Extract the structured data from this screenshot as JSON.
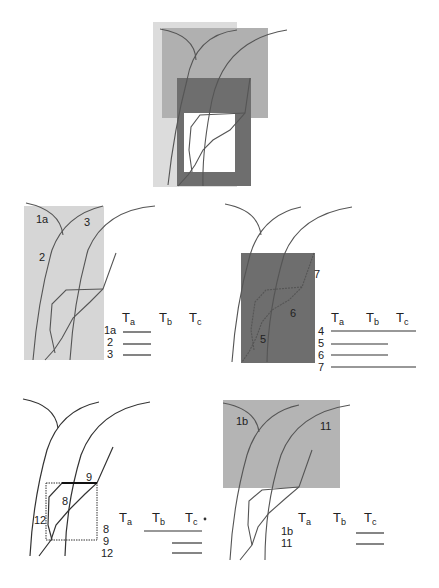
{
  "figure": {
    "colors": {
      "light_shade": "#cfcfcf",
      "mid_shade": "#a8a8a8",
      "dark_shade": "#6e6e6e",
      "line": "#333333",
      "background": "#ffffff"
    },
    "overview_panel": {
      "description": "Composite of all shaded regions"
    },
    "panels": [
      {
        "id": "panel-1",
        "region_labels": [
          "1a",
          "2",
          "3"
        ],
        "table": {
          "headers": [
            "T",
            "T",
            "T"
          ],
          "header_subscripts": [
            "a",
            "b",
            "c"
          ],
          "rows": [
            {
              "label": "1a",
              "spans": [
                "Ta"
              ]
            },
            {
              "label": "2",
              "spans": [
                "Ta"
              ]
            },
            {
              "label": "3",
              "spans": [
                "Ta"
              ]
            }
          ]
        }
      },
      {
        "id": "panel-2",
        "region_labels": [
          "7",
          "6",
          "5"
        ],
        "table": {
          "headers": [
            "T",
            "T",
            "T"
          ],
          "header_subscripts": [
            "a",
            "b",
            "c"
          ],
          "rows": [
            {
              "label": "4",
              "spans": [
                "Ta",
                "Tb",
                "Tc"
              ]
            },
            {
              "label": "5",
              "spans": [
                "Ta",
                "Tb"
              ]
            },
            {
              "label": "6",
              "spans": [
                "Ta",
                "Tb"
              ]
            },
            {
              "label": "7",
              "spans": [
                "Ta",
                "Tb",
                "Tc"
              ]
            }
          ]
        }
      },
      {
        "id": "panel-3",
        "region_labels": [
          "9",
          "8",
          "12"
        ],
        "table": {
          "headers": [
            "T",
            "T",
            "T"
          ],
          "header_subscripts": [
            "a",
            "b",
            "c"
          ],
          "rows": [
            {
              "label": "8",
              "spans": [
                "Tb",
                "Tc"
              ]
            },
            {
              "label": "9",
              "spans": [
                "Tc"
              ]
            },
            {
              "label": "12",
              "spans": [
                "Tc"
              ]
            }
          ]
        }
      },
      {
        "id": "panel-4",
        "region_labels": [
          "1b",
          "11"
        ],
        "table": {
          "headers": [
            "T",
            "T",
            "T"
          ],
          "header_subscripts": [
            "a",
            "b",
            "c"
          ],
          "rows": [
            {
              "label": "1b",
              "spans": [
                "Tc"
              ]
            },
            {
              "label": "11",
              "spans": [
                "Tc"
              ]
            }
          ]
        }
      }
    ]
  }
}
